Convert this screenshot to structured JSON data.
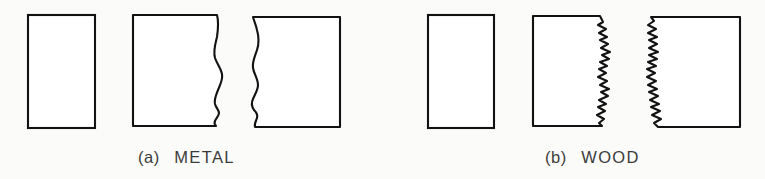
{
  "figure": {
    "background_color": "#fbfbfa",
    "line_color": "#121212",
    "fill_color": "#ffffff",
    "text_color": "#3b3b3b",
    "stroke_width": 2.1
  },
  "panels": [
    {
      "id": "a",
      "label_marker": "(a)",
      "label_name": "METAL",
      "caption": "(a)  METAL",
      "fracture_style": "smooth wavy ductile edge",
      "caption_x": 138,
      "caption_y": 163,
      "intact_specimen": {
        "name": "metal-intact-specimen",
        "x": 28,
        "y": 15,
        "width": 67,
        "height": 113
      },
      "fracture_left": {
        "name": "metal-fracture-left-piece",
        "x": 133,
        "y": 15,
        "width": 93,
        "height": 111
      },
      "fracture_right": {
        "name": "metal-fracture-right-piece",
        "x": 243,
        "y": 17,
        "width": 97,
        "height": 110
      }
    },
    {
      "id": "b",
      "label_marker": "(b)",
      "label_name": "WOOD",
      "caption": "(b)  WOOD",
      "fracture_style": "jagged splintery brittle edge",
      "caption_x": 545,
      "caption_y": 163,
      "intact_specimen": {
        "name": "wood-intact-specimen",
        "x": 428,
        "y": 15,
        "width": 66,
        "height": 113
      },
      "fracture_left": {
        "name": "wood-fracture-left-piece",
        "x": 533,
        "y": 16,
        "width": 79,
        "height": 110
      },
      "fracture_right": {
        "name": "wood-fracture-right-piece",
        "x": 645,
        "y": 17,
        "width": 95,
        "height": 110
      }
    }
  ],
  "paths": {
    "metal_left_piece": "M 133 15 L 217 15 C 219 22 218 30 217 37 C 215 45 213 51 215 58 C 217 64 221 68 222 74 C 223 80 220 85 218 90 C 216 95 214 99 215 104 C 216 108 219 110 219 113 C 219 116 216 118 215 121 C 214 123 215 125 216 126 L 133 126 Z",
    "metal_right_piece": "M 340 17 L 340 127 L 255 127 C 254 124 256 121 257 118 C 258 115 256 112 254 110 C 252 107 251 103 253 99 C 255 94 258 90 258 85 C 258 79 254 74 253 68 C 252 62 255 56 257 50 C 259 44 259 37 257 30 C 256 25 254 21 253 17 Z",
    "wood_left_piece": "M 533 16 L 600 16 L 603 22 L 598 25 L 606 29 L 599 33 L 607 37 L 600 40 L 608 44 L 601 48 L 610 52 L 602 55 L 609 59 L 600 62 L 607 66 L 599 69 L 606 73 L 598 77 L 607 81 L 600 85 L 609 89 L 601 92 L 608 96 L 599 100 L 606 104 L 598 107 L 605 111 L 597 115 L 604 119 L 599 123 L 602 126 L 533 126 Z",
    "wood_right_piece": "M 740 17 L 740 127 L 658 127 L 654 123 L 661 119 L 652 115 L 660 111 L 651 107 L 659 104 L 650 100 L 658 96 L 649 92 L 657 89 L 648 85 L 656 81 L 647 77 L 655 73 L 647 69 L 656 66 L 648 62 L 657 59 L 649 55 L 658 52 L 649 48 L 657 44 L 649 40 L 657 37 L 648 33 L 656 29 L 648 25 L 654 21 L 651 17 Z"
  }
}
